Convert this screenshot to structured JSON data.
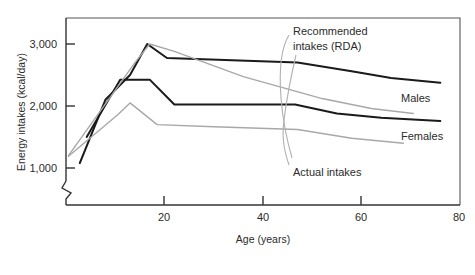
{
  "chart_data": {
    "type": "line",
    "title": "",
    "xlabel": "Age (years)",
    "ylabel": "Energy intakes (kcal/day)",
    "xlim": [
      0,
      80
    ],
    "ylim": [
      700,
      3400
    ],
    "y_axis_break": true,
    "grid": false,
    "legend_position": "inline-annotations",
    "xticks": [
      20,
      40,
      60,
      80
    ],
    "xtick_labels": [
      "20",
      "40",
      "60",
      "80"
    ],
    "yticks": [
      1000,
      2000,
      3000
    ],
    "ytick_labels": [
      "1,000",
      "2,000",
      "3,000"
    ],
    "annotations": [
      {
        "name": "rda-annotation",
        "text_line1": "Recommended",
        "text_line2": "intakes (RDA)"
      },
      {
        "name": "actual-annotation",
        "text_line1": "Actual intakes"
      }
    ],
    "series": [
      {
        "name": "Recommended intakes (RDA) - Males",
        "label": "Males",
        "color": "#1a1a1a",
        "width": 2.0,
        "points": [
          [
            2.8,
            1080
          ],
          [
            8.0,
            2100
          ],
          [
            13.0,
            2500
          ],
          [
            16.5,
            3000
          ],
          [
            20.5,
            2775
          ],
          [
            47.0,
            2700
          ],
          [
            58.0,
            2560
          ],
          [
            66.0,
            2450
          ],
          [
            76.0,
            2375
          ]
        ]
      },
      {
        "name": "Recommended intakes (RDA) - Females",
        "label": "Females",
        "color": "#1a1a1a",
        "width": 2.0,
        "points": [
          [
            4.2,
            1500
          ],
          [
            11.0,
            2425
          ],
          [
            17.0,
            2425
          ],
          [
            22.0,
            2025
          ],
          [
            46.5,
            2025
          ],
          [
            55.0,
            1880
          ],
          [
            64.0,
            1810
          ],
          [
            76.0,
            1760
          ]
        ]
      },
      {
        "name": "Actual intakes - Males",
        "label": "",
        "color": "#a8a8a8",
        "width": 1.4,
        "points": [
          [
            0.5,
            1200
          ],
          [
            14.0,
            2700
          ],
          [
            17.0,
            3000
          ],
          [
            22.0,
            2880
          ],
          [
            36.0,
            2475
          ],
          [
            52.0,
            2120
          ],
          [
            62.0,
            1960
          ],
          [
            70.5,
            1880
          ]
        ]
      },
      {
        "name": "Actual intakes - Females",
        "label": "",
        "color": "#a8a8a8",
        "width": 1.4,
        "points": [
          [
            0.5,
            1190
          ],
          [
            10.5,
            1860
          ],
          [
            13.0,
            2050
          ],
          [
            18.5,
            1700
          ],
          [
            30.0,
            1665
          ],
          [
            47.0,
            1620
          ],
          [
            58.0,
            1480
          ],
          [
            68.5,
            1400
          ]
        ]
      }
    ]
  }
}
